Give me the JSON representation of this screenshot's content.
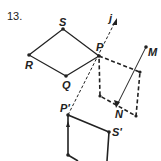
{
  "problem_number": "13.",
  "labels": {
    "S": "S",
    "R": "R",
    "Q": "Q",
    "P": "P",
    "j": "j",
    "M": "M",
    "N": "N",
    "P_prime": "P'",
    "S_prime": "S'"
  },
  "colors": {
    "stroke": "#222222",
    "background": "#ffffff"
  }
}
